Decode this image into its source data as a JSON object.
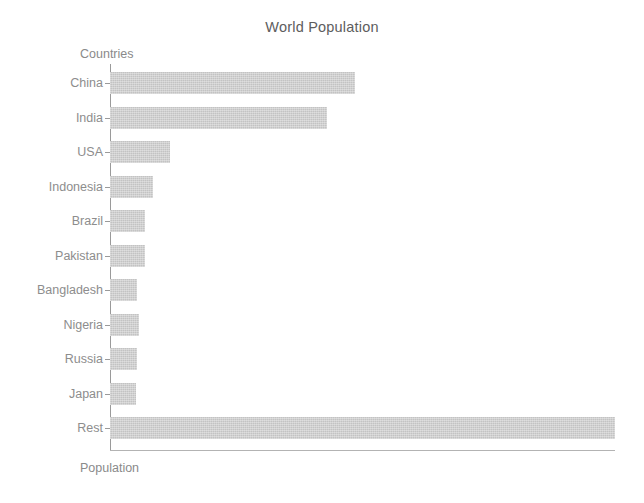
{
  "chart_data": {
    "type": "bar",
    "orientation": "horizontal",
    "title": "World Population",
    "xlabel": "Population",
    "ylabel": "Countries",
    "categories": [
      "China",
      "India",
      "USA",
      "Indonesia",
      "Brazil",
      "Pakistan",
      "Bangladesh",
      "Nigeria",
      "Russia",
      "Japan",
      "Rest"
    ],
    "values": [
      1409,
      1248,
      345,
      247,
      201,
      201,
      155,
      167,
      155,
      149,
      2904
    ],
    "value_unit": "millions",
    "xlim": [
      0,
      2904
    ],
    "ylim_categories": 11,
    "grid": false,
    "legend": null,
    "bar_color": "#c3c3c3",
    "axis_color": "#9a9a9a",
    "text_color": "#8d8d8d",
    "title_color": "#5d5d5d",
    "background": "#ffffff",
    "xticks": [],
    "yticks": [
      "China",
      "India",
      "USA",
      "Indonesia",
      "Brazil",
      "Pakistan",
      "Bangladesh",
      "Nigeria",
      "Russia",
      "Japan",
      "Rest"
    ]
  },
  "figure": {
    "title": "World Population",
    "y_axis_title": "Countries",
    "x_axis_title": "Population"
  }
}
